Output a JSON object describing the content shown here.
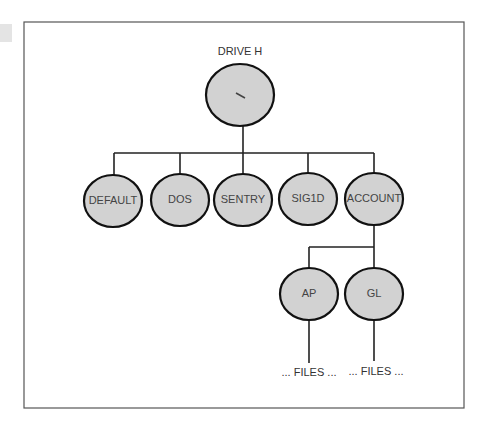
{
  "diagram": {
    "type": "directory-tree",
    "root": {
      "caption": "DRIVE H",
      "label": "\\"
    },
    "level1": [
      {
        "label": "DEFAULT"
      },
      {
        "label": "DOS"
      },
      {
        "label": "SENTRY"
      },
      {
        "label": "SIG1D"
      },
      {
        "label": "ACCOUNT"
      }
    ],
    "level2": [
      {
        "parent": "ACCOUNT",
        "label": "AP",
        "children_text": "... FILES ..."
      },
      {
        "parent": "ACCOUNT",
        "label": "GL",
        "children_text": "... FILES ..."
      }
    ]
  },
  "colors": {
    "node_fill": "#d2d2d2",
    "node_stroke": "#111111",
    "frame_stroke": "#555555"
  }
}
